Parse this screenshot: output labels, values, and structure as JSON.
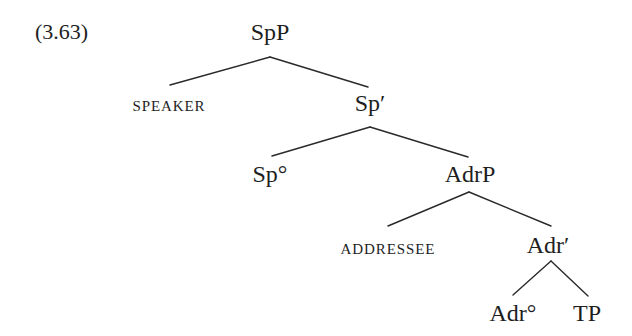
{
  "example": {
    "number": "(3.63)"
  },
  "tree": {
    "nodes": {
      "SpP": "SpP",
      "SPEAKER": "speaker",
      "Sp_bar": "Sp′",
      "Sp_head": "Sp°",
      "AdrP": "AdrP",
      "ADDRESSEE": "addressee",
      "Adr_bar": "Adr′",
      "Adr_head": "Adr°",
      "TP": "TP"
    },
    "edges": [
      [
        "SpP",
        "SPEAKER"
      ],
      [
        "SpP",
        "Sp′"
      ],
      [
        "Sp′",
        "Sp°"
      ],
      [
        "Sp′",
        "AdrP"
      ],
      [
        "AdrP",
        "ADDRESSEE"
      ],
      [
        "AdrP",
        "Adr′"
      ],
      [
        "Adr′",
        "Adr°"
      ],
      [
        "Adr′",
        "TP"
      ]
    ]
  },
  "colors": {
    "ink": "#1e1e1e",
    "background": "#ffffff"
  }
}
